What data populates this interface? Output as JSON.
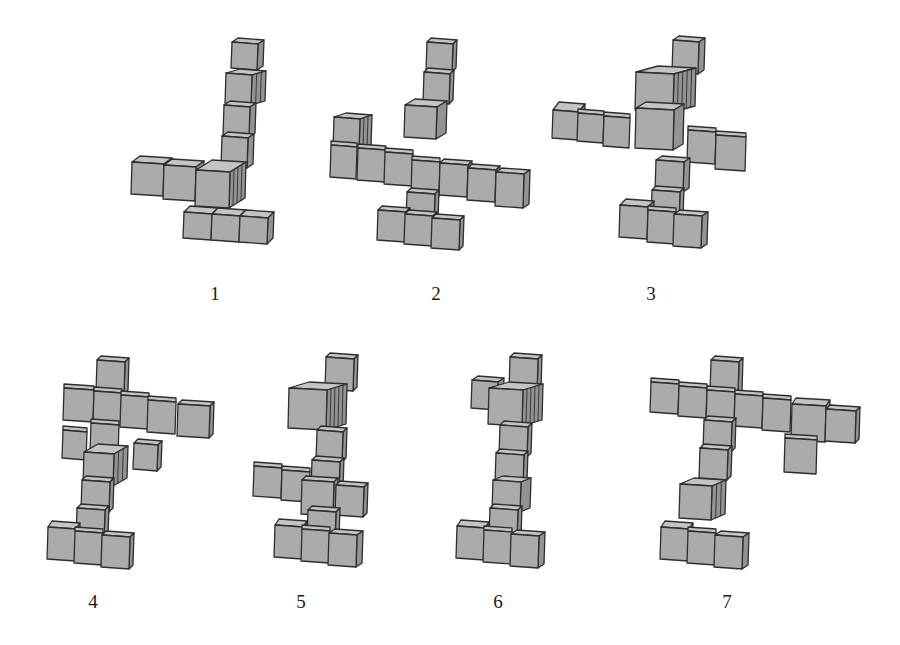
{
  "style": {
    "front_color": "#ababab",
    "top_color": "#c4c4c4",
    "side_color": "#939393",
    "edge_color": "#2e2e2e",
    "background": "#ffffff"
  },
  "figures": [
    {
      "id": 1,
      "label": "1",
      "label_pos": [
        215,
        296
      ],
      "cubes": [
        [
          232,
          42,
          26,
          26,
          6,
          -4,
          1
        ],
        [
          226,
          73,
          26,
          30,
          14,
          -4,
          1
        ],
        [
          224,
          105,
          26,
          30,
          6,
          -4,
          1
        ],
        [
          222,
          136,
          26,
          30,
          6,
          -4,
          1
        ],
        [
          184,
          212,
          28,
          26,
          6,
          -6,
          1
        ],
        [
          212,
          214,
          28,
          26,
          6,
          -6,
          1
        ],
        [
          240,
          216,
          28,
          26,
          6,
          -6,
          1
        ],
        [
          132,
          162,
          32,
          32,
          8,
          -6,
          1
        ],
        [
          164,
          165,
          32,
          34,
          8,
          -6,
          1
        ],
        [
          196,
          170,
          34,
          36,
          16,
          -10,
          1
        ]
      ]
    },
    {
      "id": 2,
      "label": "2",
      "label_pos": [
        436,
        296
      ],
      "cubes": [
        [
          427,
          42,
          26,
          28,
          4,
          -4,
          1
        ],
        [
          424,
          72,
          26,
          30,
          4,
          -4,
          1
        ],
        [
          405,
          105,
          32,
          32,
          10,
          -6,
          1
        ],
        [
          334,
          117,
          26,
          32,
          12,
          -4,
          1
        ],
        [
          331,
          145,
          26,
          32,
          0,
          -4,
          1
        ],
        [
          358,
          148,
          28,
          32,
          0,
          -4,
          1
        ],
        [
          385,
          152,
          28,
          32,
          0,
          -4,
          1
        ],
        [
          412,
          160,
          28,
          34,
          0,
          -4,
          1
        ],
        [
          440,
          163,
          28,
          32,
          4,
          -4,
          1
        ],
        [
          468,
          168,
          28,
          32,
          4,
          -4,
          1
        ],
        [
          496,
          172,
          28,
          34,
          6,
          -4,
          1
        ],
        [
          407,
          192,
          28,
          30,
          4,
          -4,
          1
        ],
        [
          378,
          210,
          28,
          30,
          4,
          -4,
          1
        ],
        [
          405,
          214,
          28,
          30,
          4,
          -4,
          1
        ],
        [
          432,
          218,
          28,
          30,
          4,
          -4,
          1
        ]
      ]
    },
    {
      "id": 3,
      "label": "3",
      "label_pos": [
        651,
        296
      ],
      "cubes": [
        [
          673,
          40,
          26,
          32,
          6,
          -4,
          1
        ],
        [
          636,
          72,
          38,
          38,
          22,
          -6,
          1
        ],
        [
          636,
          108,
          38,
          40,
          10,
          -6,
          1
        ],
        [
          553,
          110,
          26,
          28,
          6,
          -8,
          1
        ],
        [
          578,
          113,
          26,
          28,
          0,
          -4,
          1
        ],
        [
          604,
          116,
          26,
          30,
          0,
          -4,
          1
        ],
        [
          688,
          130,
          28,
          32,
          0,
          -4,
          1
        ],
        [
          716,
          135,
          30,
          34,
          0,
          -4,
          1
        ],
        [
          656,
          160,
          28,
          30,
          6,
          -4,
          1
        ],
        [
          652,
          190,
          28,
          30,
          4,
          -4,
          1
        ],
        [
          620,
          205,
          28,
          32,
          6,
          -6,
          1
        ],
        [
          648,
          210,
          28,
          32,
          0,
          -4,
          1
        ],
        [
          674,
          214,
          28,
          32,
          6,
          -4,
          1
        ]
      ]
    },
    {
      "id": 4,
      "label": "4",
      "label_pos": [
        93,
        604
      ],
      "cubes": [
        [
          97,
          360,
          28,
          32,
          4,
          -4,
          1
        ],
        [
          64,
          388,
          30,
          32,
          0,
          -4,
          1
        ],
        [
          94,
          391,
          28,
          32,
          0,
          -4,
          1
        ],
        [
          121,
          395,
          28,
          32,
          0,
          -4,
          1
        ],
        [
          148,
          400,
          28,
          32,
          0,
          -4,
          1
        ],
        [
          178,
          404,
          32,
          32,
          4,
          -4,
          1
        ],
        [
          63,
          430,
          24,
          28,
          0,
          -4,
          1
        ],
        [
          91,
          423,
          28,
          30,
          0,
          -4,
          1
        ],
        [
          134,
          443,
          24,
          26,
          4,
          -4,
          1
        ],
        [
          84,
          452,
          30,
          32,
          14,
          -8,
          1
        ],
        [
          82,
          480,
          28,
          30,
          4,
          -4,
          1
        ],
        [
          77,
          508,
          28,
          30,
          4,
          -4,
          1
        ],
        [
          48,
          527,
          28,
          32,
          4,
          -6,
          1
        ],
        [
          75,
          531,
          28,
          32,
          0,
          -4,
          1
        ],
        [
          102,
          535,
          28,
          32,
          4,
          -4,
          1
        ]
      ]
    },
    {
      "id": 5,
      "label": "5",
      "label_pos": [
        301,
        604
      ],
      "cubes": [
        [
          326,
          357,
          28,
          32,
          4,
          -4,
          1
        ],
        [
          289,
          388,
          38,
          40,
          20,
          -6,
          1
        ],
        [
          317,
          430,
          26,
          30,
          4,
          -4,
          1
        ],
        [
          312,
          460,
          28,
          30,
          4,
          -4,
          1
        ],
        [
          254,
          466,
          28,
          30,
          0,
          -4,
          1
        ],
        [
          282,
          470,
          28,
          30,
          0,
          -4,
          1
        ],
        [
          302,
          480,
          32,
          34,
          4,
          -4,
          1
        ],
        [
          336,
          485,
          28,
          30,
          4,
          -4,
          1
        ],
        [
          308,
          510,
          28,
          30,
          4,
          -4,
          1
        ],
        [
          275,
          525,
          28,
          32,
          4,
          -6,
          1
        ],
        [
          302,
          529,
          28,
          32,
          0,
          -4,
          1
        ],
        [
          329,
          533,
          28,
          32,
          6,
          -4,
          1
        ]
      ]
    },
    {
      "id": 6,
      "label": "6",
      "label_pos": [
        498,
        604
      ],
      "cubes": [
        [
          510,
          357,
          28,
          34,
          4,
          -4,
          1
        ],
        [
          472,
          380,
          26,
          28,
          6,
          -4,
          1
        ],
        [
          489,
          388,
          34,
          36,
          20,
          -6,
          1
        ],
        [
          500,
          425,
          28,
          30,
          4,
          -4,
          1
        ],
        [
          496,
          453,
          28,
          30,
          4,
          -4,
          1
        ],
        [
          493,
          480,
          28,
          30,
          10,
          -4,
          1
        ],
        [
          490,
          508,
          28,
          30,
          4,
          -4,
          1
        ],
        [
          457,
          526,
          28,
          32,
          4,
          -6,
          1
        ],
        [
          484,
          530,
          28,
          32,
          0,
          -4,
          1
        ],
        [
          511,
          534,
          28,
          32,
          6,
          -4,
          1
        ]
      ]
    },
    {
      "id": 7,
      "label": "7",
      "label_pos": [
        727,
        604
      ],
      "cubes": [
        [
          711,
          360,
          28,
          32,
          4,
          -4,
          1
        ],
        [
          651,
          382,
          28,
          30,
          0,
          -4,
          1
        ],
        [
          679,
          386,
          28,
          30,
          0,
          -4,
          1
        ],
        [
          707,
          390,
          28,
          34,
          0,
          -4,
          1
        ],
        [
          735,
          394,
          28,
          32,
          0,
          -4,
          1
        ],
        [
          763,
          398,
          28,
          32,
          0,
          -4,
          1
        ],
        [
          792,
          404,
          34,
          36,
          4,
          -6,
          1
        ],
        [
          826,
          409,
          30,
          32,
          4,
          -4,
          1
        ],
        [
          785,
          438,
          32,
          34,
          0,
          -4,
          1
        ],
        [
          704,
          420,
          28,
          30,
          4,
          -4,
          1
        ],
        [
          700,
          448,
          28,
          30,
          4,
          -4,
          1
        ],
        [
          680,
          484,
          32,
          34,
          14,
          -6,
          1
        ],
        [
          661,
          527,
          28,
          32,
          4,
          -6,
          1
        ],
        [
          688,
          531,
          28,
          32,
          0,
          -4,
          1
        ],
        [
          715,
          535,
          28,
          32,
          6,
          -4,
          1
        ]
      ]
    }
  ]
}
